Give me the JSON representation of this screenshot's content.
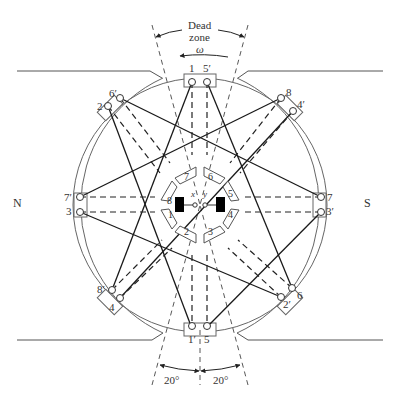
{
  "diagram": {
    "poles": {
      "north": "N",
      "south": "S"
    },
    "dead_zone": {
      "line1": "Dead",
      "line2": "zone",
      "rotation_symbol": "ω"
    },
    "angles": {
      "left": "20°",
      "right": "20°"
    },
    "brush_terminals": {
      "x": "x",
      "y": "y"
    },
    "slot_labels": {
      "top_left": "1",
      "top_right": "5′",
      "ul_outer": "2",
      "ul_inner": "6′",
      "ur_inner": "8",
      "ur_outer": "4′",
      "left_top": "7′",
      "left_bottom": "3",
      "right_top": "7",
      "right_bottom": "3′",
      "ll_inner": "8′",
      "ll_outer": "4",
      "lr_inner": "2′",
      "lr_outer": "6",
      "bottom_left": "1′",
      "bottom_right": "5"
    },
    "commutator_segments": [
      "1",
      "2",
      "3",
      "4",
      "5",
      "6",
      "7",
      "8"
    ],
    "colors": {
      "line": "#222222",
      "frame": "#666666",
      "brush": "#000000"
    }
  }
}
